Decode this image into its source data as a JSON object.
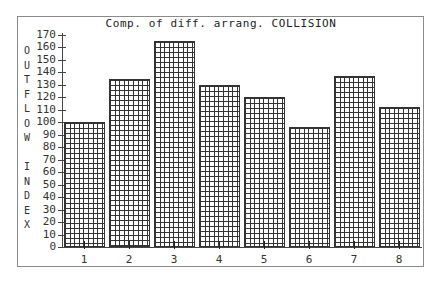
{
  "chart_data": {
    "type": "bar",
    "title": "Comp. of diff. arrang. COLLISION",
    "xlabel": "",
    "ylabel": "OUTFLOW INDEX",
    "ylabel_chars": [
      "O",
      "U",
      "T",
      "F",
      "L",
      "O",
      "W",
      " ",
      "I",
      "N",
      "D",
      "E",
      "X"
    ],
    "categories": [
      "1",
      "2",
      "3",
      "4",
      "5",
      "6",
      "7",
      "8"
    ],
    "values": [
      100,
      135,
      165,
      130,
      120,
      96,
      137,
      112
    ],
    "ylim": [
      0,
      170
    ],
    "yticks": [
      0,
      10,
      20,
      30,
      40,
      50,
      60,
      70,
      80,
      90,
      100,
      110,
      120,
      130,
      140,
      150,
      160,
      170
    ],
    "grid": false,
    "legend": null,
    "bar_fill": "crosshatch-grid"
  },
  "colors": {
    "frame": "#8a8a8a",
    "axis": "#444444",
    "bar_line": "#333333",
    "background": "#ffffff"
  }
}
